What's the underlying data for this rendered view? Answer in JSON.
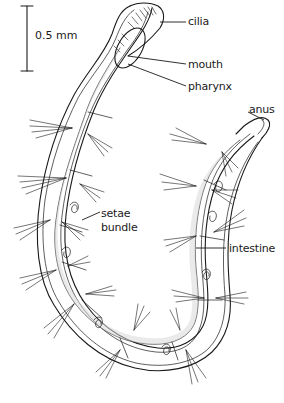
{
  "figure": {
    "type": "anatomical line drawing"
  },
  "scale_bar": {
    "label": "0.5 mm"
  },
  "labels": {
    "cilia": "cilia",
    "mouth": "mouth",
    "pharynx": "pharynx",
    "anus": "anus",
    "setae_line1": "setae",
    "setae_line2": "bundle",
    "intestine": "intestine"
  },
  "colors": {
    "ink": "#1a1a1a",
    "background": "#ffffff",
    "stipple": "#d9d9d9"
  }
}
